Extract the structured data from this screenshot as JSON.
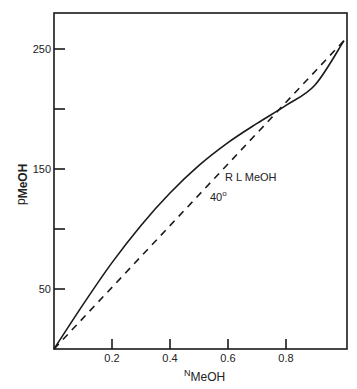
{
  "chart_data": {
    "type": "line",
    "title": "",
    "xlabel": "N_MeOH",
    "xlabel_main": "N",
    "xlabel_sub": "MeOH",
    "ylabel": "p_MeOH",
    "ylabel_main": "p",
    "ylabel_sub": "MeOH",
    "xlim": [
      0,
      1.0
    ],
    "ylim": [
      0,
      280
    ],
    "grid": false,
    "x_ticks": [
      0.2,
      0.4,
      0.6,
      0.8
    ],
    "x_tick_labels": [
      "0.2",
      "0.4",
      "0.6",
      "0.8"
    ],
    "y_ticks": [
      50,
      100,
      150,
      200,
      250
    ],
    "y_tick_labels": [
      "50",
      "",
      "150",
      "",
      "250"
    ],
    "series": [
      {
        "name": "Measured vapour pressure (solid)",
        "style": "solid",
        "x": [
          0,
          0.1,
          0.2,
          0.3,
          0.4,
          0.5,
          0.6,
          0.7,
          0.8,
          0.9,
          1.0
        ],
        "values": [
          0,
          37,
          72,
          103,
          130,
          153,
          172,
          188,
          203,
          220,
          257
        ]
      },
      {
        "name": "Raoult's law (dashed)",
        "style": "dashed",
        "x": [
          0,
          1.0
        ],
        "values": [
          0,
          257
        ]
      }
    ],
    "annotations": [
      {
        "text": "RL  MeOH",
        "x": 0.6,
        "y": 158
      },
      {
        "text": "40°",
        "x": 0.58,
        "y": 140
      }
    ]
  },
  "labels": {
    "annot_rl": "R L   MeOH",
    "annot_temp": "40",
    "annot_deg": "o"
  }
}
